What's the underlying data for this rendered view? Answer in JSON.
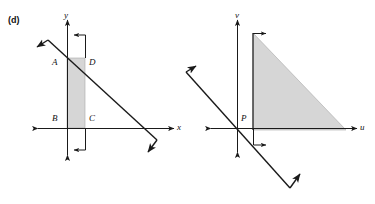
{
  "figure": {
    "part_label": "(d)",
    "background_color": "#ffffff",
    "ink_color": "#1a1a1a",
    "shade_color": "#d6d6d6",
    "shade_stroke_color": "#8f8f8f"
  },
  "left_diagram": {
    "name": "xy-plane-region",
    "axes": {
      "x_label": "x",
      "y_label": "y"
    },
    "vertex_labels": [
      {
        "id": "A",
        "text": "A"
      },
      {
        "id": "D",
        "text": "D"
      },
      {
        "id": "B",
        "text": "B"
      },
      {
        "id": "C",
        "text": "C"
      }
    ],
    "region": {
      "type": "shaded-rectangle",
      "description": "vertical shaded strip from A,D at top to B,C at bottom"
    },
    "diagonal_line": {
      "description": "line through D sloping down to the right, bent arrowheads at both ends"
    }
  },
  "right_diagram": {
    "name": "uv-plane-region",
    "axes": {
      "u_label": "u",
      "v_label": "v"
    },
    "vertex_labels": [
      {
        "id": "P",
        "text": "P"
      }
    ],
    "region": {
      "type": "shaded-right-triangle",
      "description": "right triangle with vertical leg on left, horizontal leg on bottom, hypotenuse from top-left to bottom-right"
    },
    "diagonal_line": {
      "description": "line sloping down to the right crossing below origin, bent arrowheads at both ends"
    }
  }
}
